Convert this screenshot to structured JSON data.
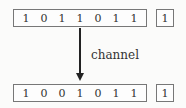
{
  "top": {
    "bits": [
      "1",
      "0",
      "1",
      "1",
      "0",
      "1",
      "1"
    ],
    "parity": "1"
  },
  "channel_label": "channel",
  "bottom": {
    "bits": [
      "1",
      "0",
      "0",
      "1",
      "0",
      "1",
      "1"
    ],
    "parity": "1"
  }
}
